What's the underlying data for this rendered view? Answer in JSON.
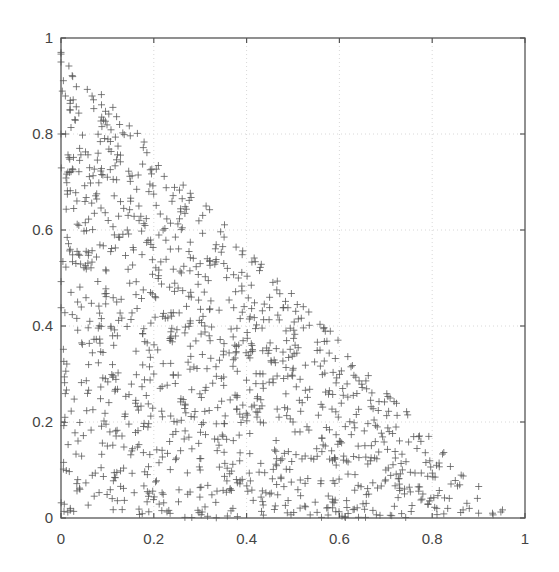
{
  "chart_data": {
    "type": "scatter",
    "title": "",
    "xlabel": "",
    "ylabel": "",
    "xlim": [
      0,
      1
    ],
    "ylim": [
      0,
      1
    ],
    "xticks": [
      0,
      0.2,
      0.4,
      0.6,
      0.8,
      1
    ],
    "yticks": [
      0,
      0.2,
      0.4,
      0.6,
      0.8,
      1
    ],
    "xtick_labels": [
      "0",
      "0.2",
      "0.4",
      "0.6",
      "0.8",
      "1"
    ],
    "ytick_labels": [
      "0",
      "0.2",
      "0.4",
      "0.6",
      "0.8",
      "1"
    ],
    "grid": true,
    "grid_style": "dotted",
    "legend": null,
    "marker": "+",
    "marker_color": "#555555",
    "distribution": {
      "region": "x + y <= 1, x >= 0, y >= 0",
      "count": 1200,
      "seed": 12345,
      "max_x_observed": 0.93,
      "max_y_observed": 0.97
    },
    "series": [
      {
        "name": "samples",
        "points": [
          [
            0.0,
            0.97
          ],
          [
            0.0,
            0.95
          ],
          [
            0.02,
            0.87
          ],
          [
            0.02,
            0.85
          ],
          [
            0.03,
            0.83
          ],
          [
            0.0,
            0.8
          ],
          [
            0.01,
            0.8
          ],
          [
            0.04,
            0.77
          ],
          [
            0.08,
            0.76
          ],
          [
            0.1,
            0.71
          ],
          [
            0.15,
            0.66
          ],
          [
            0.22,
            0.6
          ],
          [
            0.3,
            0.53
          ],
          [
            0.35,
            0.34
          ],
          [
            0.42,
            0.28
          ],
          [
            0.5,
            0.2
          ],
          [
            0.6,
            0.16
          ],
          [
            0.7,
            0.1
          ],
          [
            0.78,
            0.05
          ],
          [
            0.81,
            0.02
          ],
          [
            0.88,
            0.02
          ],
          [
            0.9,
            0.01
          ],
          [
            0.93,
            0.01
          ],
          [
            0.02,
            0.02
          ],
          [
            0.2,
            0.3
          ],
          [
            0.12,
            0.45
          ],
          [
            0.3,
            0.1
          ],
          [
            0.45,
            0.05
          ],
          [
            0.25,
            0.2
          ],
          [
            0.1,
            0.15
          ]
        ]
      }
    ]
  }
}
